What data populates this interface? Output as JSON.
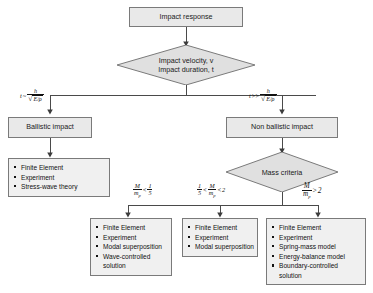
{
  "diagram": {
    "colors": {
      "node_fill": "#e9e9e9",
      "list_fill": "#f0f0f0",
      "border": "#7a7a7a",
      "text": "#1a1a1a",
      "line": "#4a4a4a"
    },
    "nodes": {
      "root": {
        "label": "Impact response"
      },
      "criteria_decision": {
        "line1": "Impact velocity, v",
        "line2": "Impact duration, t"
      },
      "ballistic": {
        "label": "Ballistic impact"
      },
      "non_ballistic": {
        "label": "Non ballistic impact"
      },
      "mass_criteria": {
        "label": "Mass criteria"
      }
    },
    "edge_labels": {
      "left_duration": {
        "text": "t ~ h / sqrt(E/rho)",
        "var": "t",
        "operator": "~",
        "numerator": "h",
        "denominator_radicand": "E/ρ"
      },
      "right_duration": {
        "text": "t >> h / sqrt(E/rho)",
        "var": "t",
        "operator": ">>",
        "numerator": "h",
        "denominator_radicand": "E/ρ"
      },
      "mass_low": {
        "text": "M/m_p < 1/5",
        "ratio_num": "M",
        "ratio_den": "m",
        "ratio_den_sub": "p",
        "operator": "<",
        "bound_num": "1",
        "bound_den": "5"
      },
      "mass_mid": {
        "text": "1/5 < M/m_p < 2",
        "left_num": "1",
        "left_den": "5",
        "operator_left": "<",
        "ratio_num": "M",
        "ratio_den": "m",
        "ratio_den_sub": "p",
        "operator_right": "<",
        "bound": "2"
      },
      "mass_high": {
        "text": "M/m_p > 2",
        "ratio_num": "M",
        "ratio_den": "m",
        "ratio_den_sub": "p",
        "operator": ">",
        "bound": "2"
      }
    },
    "method_lists": {
      "ballistic_methods": {
        "items": [
          "Finite Element",
          "Experiment",
          "Stress-wave theory"
        ]
      },
      "mass_low_methods": {
        "items": [
          "Finite Element",
          "Experiment",
          "Modal superposition",
          "Wave-controlled solution"
        ]
      },
      "mass_mid_methods": {
        "items": [
          "Finite Element",
          "Experiment",
          "Modal superposition"
        ]
      },
      "mass_high_methods": {
        "items": [
          "Finite Element",
          "Experiment",
          "Spring-mass model",
          "Energy-balance model",
          "Boundary-controlled solution"
        ]
      }
    }
  }
}
